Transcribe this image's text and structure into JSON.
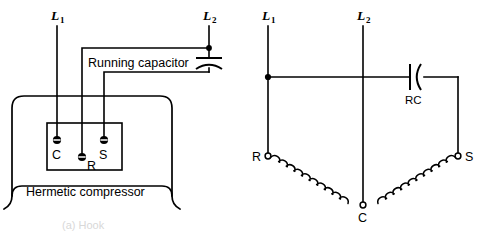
{
  "figure": {
    "caption_partial": "(a) Hook",
    "line_color": "#000000",
    "background_color": "#ffffff"
  },
  "left_diagram": {
    "name": "pictorial-wiring",
    "supply_lines": [
      {
        "id": "L1",
        "label": "L",
        "subscript": "1"
      },
      {
        "id": "L2",
        "label": "L",
        "subscript": "2"
      }
    ],
    "component_label": "Running capacitor",
    "enclosure_label": "Hermetic compressor",
    "terminals": [
      {
        "id": "C",
        "label": "C",
        "type": "solid-terminal"
      },
      {
        "id": "R",
        "label": "R",
        "type": "solid-terminal"
      },
      {
        "id": "S",
        "label": "S",
        "type": "solid-terminal"
      }
    ],
    "junction_dots": 1
  },
  "right_diagram": {
    "name": "schematic-wiring",
    "supply_lines": [
      {
        "id": "L1",
        "label": "L",
        "subscript": "1"
      },
      {
        "id": "L2",
        "label": "L",
        "subscript": "2"
      }
    ],
    "capacitor_label": "RC",
    "terminals": [
      {
        "id": "R",
        "label": "R",
        "type": "open-terminal"
      },
      {
        "id": "S",
        "label": "S",
        "type": "open-terminal"
      },
      {
        "id": "C",
        "label": "C",
        "type": "open-terminal"
      }
    ],
    "windings": [
      {
        "id": "start-winding",
        "from": "R",
        "to": "C"
      },
      {
        "id": "run-winding",
        "from": "C",
        "to": "S"
      }
    ],
    "junction_dots": 1
  }
}
